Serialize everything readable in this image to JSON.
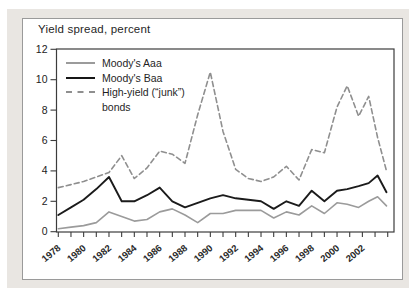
{
  "figure": {
    "title": "Yield spread, percent"
  },
  "chart_data": {
    "type": "line",
    "title": "Yield spread, percent",
    "ylabel": "Yield spread, percent",
    "ylim": [
      0,
      12
    ],
    "yticks": [
      0,
      2,
      4,
      6,
      8,
      10,
      12
    ],
    "x_range": [
      1978,
      2004
    ],
    "xtick_minor_every_years": 1,
    "xtick_labels": [
      1978,
      1980,
      1982,
      1984,
      1986,
      1988,
      1990,
      1992,
      1994,
      1996,
      1998,
      2000,
      2002
    ],
    "grid": false,
    "legend_position": "top-left",
    "x": [
      1978,
      1979,
      1980,
      1981,
      1982,
      1983,
      1984,
      1985,
      1986,
      1987,
      1988,
      1989,
      1990,
      1991,
      1992,
      1993,
      1994,
      1995,
      1996,
      1997,
      1998,
      1999,
      2000,
      2000.8,
      2001.7,
      2002.5,
      2003.2,
      2003.9
    ],
    "series": [
      {
        "name": "Moody's Aaa",
        "style": "solid",
        "color": "#9b9b9b",
        "values": [
          0.2,
          0.3,
          0.4,
          0.6,
          1.3,
          1.0,
          0.7,
          0.8,
          1.3,
          1.5,
          1.1,
          0.6,
          1.2,
          1.2,
          1.4,
          1.4,
          1.4,
          0.9,
          1.3,
          1.1,
          1.7,
          1.2,
          1.9,
          1.8,
          1.6,
          2.0,
          2.3,
          1.7
        ]
      },
      {
        "name": "Moody's Baa",
        "style": "solid",
        "color": "#1b1b1b",
        "values": [
          1.1,
          1.6,
          2.1,
          2.8,
          3.6,
          2.0,
          2.0,
          2.4,
          2.9,
          2.0,
          1.6,
          1.9,
          2.2,
          2.4,
          2.2,
          2.1,
          2.0,
          1.5,
          2.0,
          1.7,
          2.7,
          2.0,
          2.7,
          2.8,
          3.0,
          3.2,
          3.7,
          2.6
        ]
      },
      {
        "name": "High-yield (“junk”) bonds",
        "style": "dashed",
        "color": "#8f8f8f",
        "values": [
          2.9,
          3.1,
          3.3,
          3.6,
          3.9,
          5.0,
          3.5,
          4.2,
          5.3,
          5.1,
          4.5,
          7.7,
          10.5,
          6.6,
          4.1,
          3.5,
          3.3,
          3.6,
          4.3,
          3.4,
          5.4,
          5.2,
          8.2,
          9.6,
          7.6,
          8.9,
          6.2,
          4.0
        ]
      }
    ]
  }
}
